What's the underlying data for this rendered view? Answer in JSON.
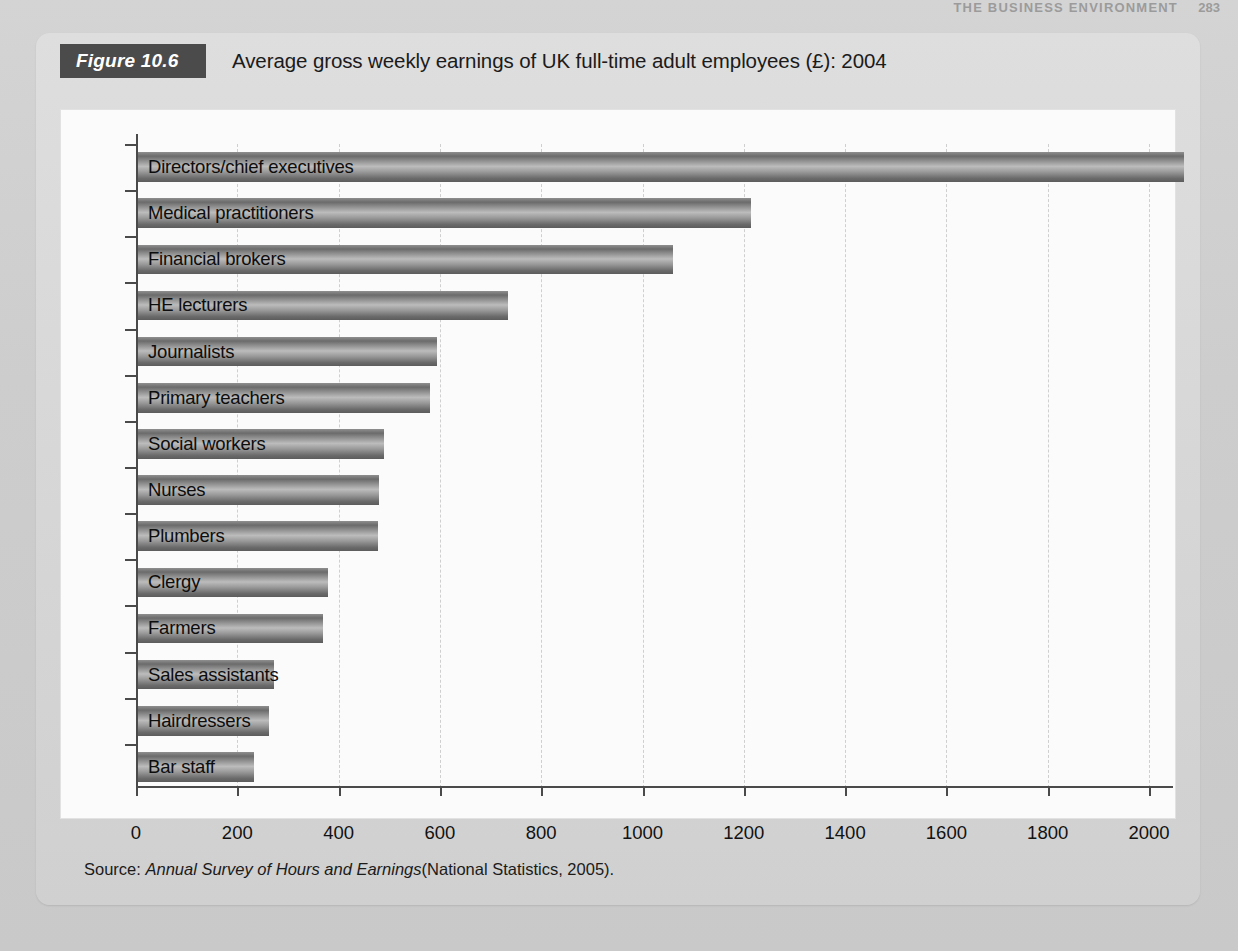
{
  "running_head": {
    "text": "THE BUSINESS ENVIRONMENT",
    "page_number": "283"
  },
  "figure": {
    "tag_label": "Figure 10.6",
    "title": "Average gross weekly earnings of UK full-time adult employees (£): 2004",
    "source_prefix": "Source:",
    "source_italic": "Annual Survey of Hours and Earnings",
    "source_suffix": "(National Statistics, 2005).",
    "colors": {
      "tag_background": "#4b4b4b",
      "panel_background": "#d8d8d8",
      "plot_background": "#fbfbfb",
      "bar_dark": "#5c5c5c",
      "bar_light": "#bcbcbc",
      "axis": "#4a4a4a",
      "gridline": "#cfcfcf"
    }
  },
  "chart_data": {
    "type": "bar",
    "orientation": "horizontal",
    "title": "Average gross weekly earnings of UK full-time adult employees (£): 2004",
    "xlabel": "",
    "ylabel": "",
    "xlim": [
      0,
      2100
    ],
    "xticks": [
      0,
      200,
      400,
      600,
      800,
      1000,
      1200,
      1400,
      1600,
      1800,
      2000
    ],
    "xticklabels": [
      "0",
      "200",
      "400",
      "600",
      "800",
      "1000",
      "1200",
      "1400",
      "1600",
      "1800",
      "2000"
    ],
    "grid": "vertical-dashed",
    "legend": "none",
    "value_unit": "£ per week",
    "categories": [
      "Directors/chief executives",
      "Medical practitioners",
      "Financial brokers",
      "HE lecturers",
      "Journalists",
      "Primary teachers",
      "Social workers",
      "Nurses",
      "Plumbers",
      "Clergy",
      "Farmers",
      "Sales assistants",
      "Hairdressers",
      "Bar staff"
    ],
    "values": [
      2070,
      1215,
      1060,
      735,
      595,
      580,
      490,
      480,
      478,
      380,
      370,
      272,
      263,
      232
    ]
  }
}
